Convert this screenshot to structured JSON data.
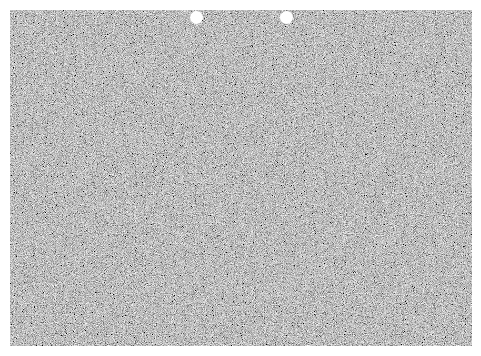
{
  "canvas": {
    "width": 481,
    "height": 356,
    "background": "#ffffff"
  },
  "sheet": {
    "texture": "gray-noise",
    "base_color": "#8a8a8a"
  },
  "holes": [
    {
      "name": "left-hole",
      "cx": 196,
      "cy": 17,
      "r": 6.5,
      "color": "#ffffff"
    },
    {
      "name": "right-hole",
      "cx": 286,
      "cy": 17,
      "r": 6.5,
      "color": "#ffffff"
    }
  ]
}
